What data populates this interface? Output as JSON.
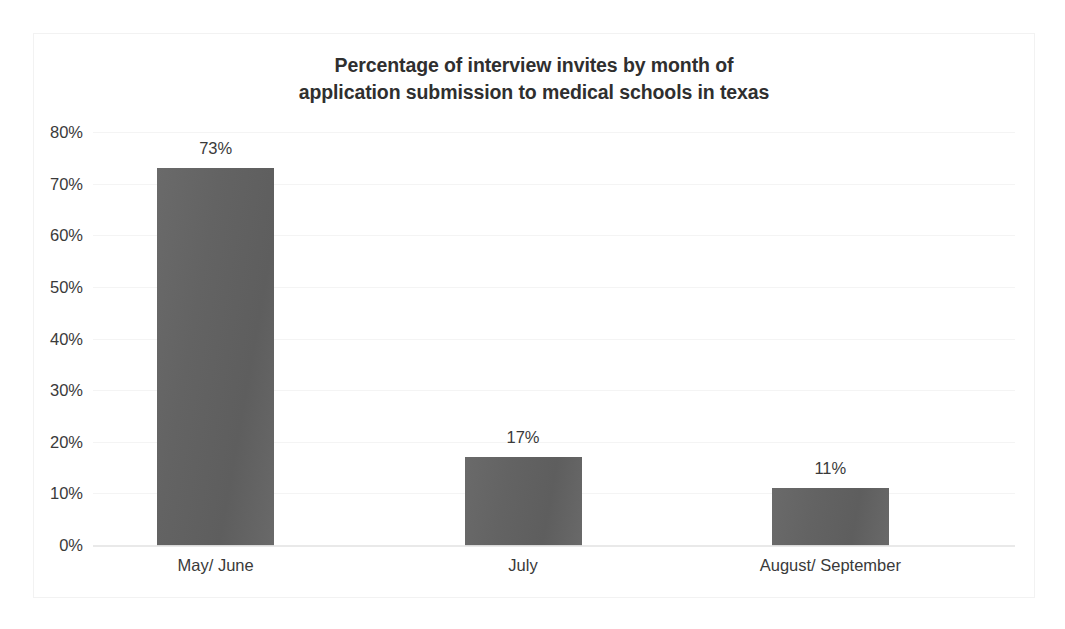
{
  "chart_data": {
    "type": "bar",
    "title": "Percentage of interview invites by month of application submission to medical schools in texas",
    "title_lines": [
      "Percentage of interview invites by month of",
      "application submission to medical schools in texas"
    ],
    "categories": [
      "May/ June",
      "July",
      "August/ September"
    ],
    "values": [
      73,
      17,
      11
    ],
    "value_labels": [
      "73%",
      "17%",
      "11%"
    ],
    "xlabel": "",
    "ylabel": "",
    "ylim": [
      0,
      80
    ],
    "y_ticks": [
      0,
      10,
      20,
      30,
      40,
      50,
      60,
      70,
      80
    ],
    "y_tick_labels": [
      "0%",
      "10%",
      "20%",
      "30%",
      "40%",
      "50%",
      "60%",
      "70%",
      "80%"
    ],
    "grid": true,
    "legend": false,
    "legend_position": "none",
    "series": [
      {
        "name": "Percentage of interview invites",
        "values": [
          73,
          17,
          11
        ]
      }
    ],
    "colors": {
      "bar_fill": "#636363",
      "bar_fill_light": "#6a6a6a",
      "gridline": "#f4f4f4",
      "baseline": "#e9e9e9",
      "text": "#3a3a3a",
      "title_text": "#2f2f2f",
      "plot_background": "#ffffff",
      "frame_border": "#f2f2f2"
    }
  }
}
